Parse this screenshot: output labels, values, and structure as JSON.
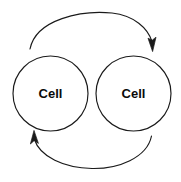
{
  "diagram": {
    "type": "cycle-diagram",
    "background_color": "#ffffff",
    "stroke_color": "#1a1a1a",
    "text_color": "#0a0a0a",
    "nodes": [
      {
        "id": "cell-left",
        "label": "Cell",
        "cx": 50.5,
        "cy": 93.5,
        "r": 37.5
      },
      {
        "id": "cell-right",
        "label": "Cell",
        "cx": 133.5,
        "cy": 93.5,
        "r": 37.5
      }
    ],
    "arrows": [
      {
        "id": "arrow-top",
        "from": "cell-left",
        "to": "cell-right",
        "direction": "left-to-right",
        "arrowhead": "down",
        "label": ""
      },
      {
        "id": "arrow-bottom",
        "from": "cell-right",
        "to": "cell-left",
        "direction": "right-to-left",
        "arrowhead": "up",
        "label": ""
      }
    ]
  }
}
